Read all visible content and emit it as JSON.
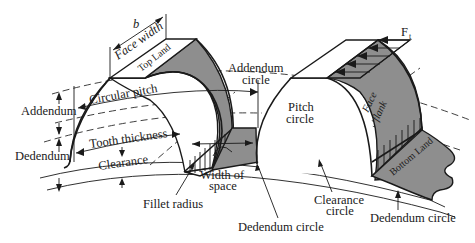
{
  "diagram": {
    "colors": {
      "line": "#1a1a1a",
      "shade": "#8e8e8e",
      "background": "#ffffff"
    },
    "labels": {
      "b": "b",
      "face_width": "Face width",
      "top_land": "Top Land",
      "addendum_circle_1": "Addendum",
      "addendum_circle_2": "circle",
      "circular_pitch": "Circular pitch",
      "addendum": "Addendum",
      "tooth_thickness": "Tooth thickness",
      "dedendum": "Dedendum",
      "clearance": "Clearance",
      "fillet_radius": "Fillet radius",
      "width_of_space_1": "Width of",
      "width_of_space_2": "space",
      "dedendum_circle_center": "Dedendum circle",
      "pitch_circle_1": "Pitch",
      "pitch_circle_2": "circle",
      "face_1": "Face",
      "flank": "flank",
      "force": "F",
      "force_sub": "t",
      "bottom_land": "Bottom Land",
      "clearance_circle_1": "Clearance",
      "clearance_circle_2": "circle",
      "dedendum_circle_right": "Dedendum circle"
    }
  }
}
